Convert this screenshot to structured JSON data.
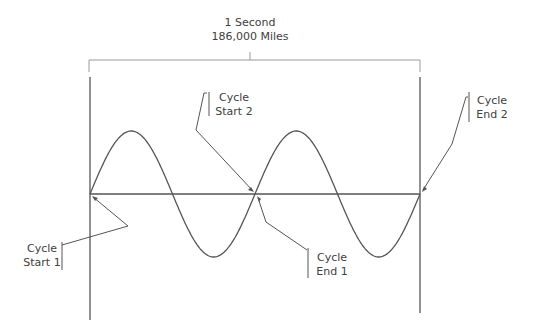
{
  "diagram": {
    "title_line1": "1 Second",
    "title_line2": "186,000 Miles",
    "wave": {
      "cycles": 2,
      "description": "sine wave over one second"
    },
    "labels": {
      "cycle_start_1": {
        "line1": "Cycle",
        "line2": "Start 1"
      },
      "cycle_start_2": {
        "line1": "Cycle",
        "line2": "Start 2"
      },
      "cycle_end_1": {
        "line1": "Cycle",
        "line2": "End 1"
      },
      "cycle_end_2": {
        "line1": "Cycle",
        "line2": "End 2"
      }
    },
    "colors": {
      "line": "#555555",
      "text": "#404040"
    }
  }
}
